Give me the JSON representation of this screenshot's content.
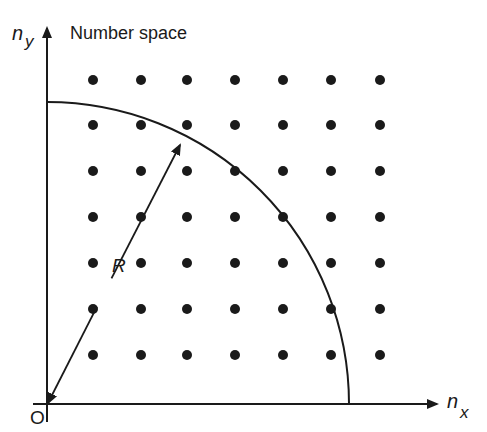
{
  "title": "Number space",
  "axes": {
    "x_label": "n",
    "x_subscript": "x",
    "y_label": "n",
    "y_subscript": "y",
    "origin_label": "O"
  },
  "radius_label": "R",
  "geometry": {
    "origin": [
      47,
      404
    ],
    "x_axis_end": 437,
    "y_axis_end": 28,
    "arc_radius": 302,
    "radius_arrow_tip": [
      180,
      145
    ],
    "lattice_columns": [
      93,
      141,
      187,
      235,
      283,
      331,
      380
    ],
    "lattice_rows": [
      80,
      125,
      171,
      217,
      263,
      309,
      355
    ],
    "dot_radius": 5
  },
  "colors": {
    "ink": "#1a1a1a",
    "background": "#ffffff"
  }
}
